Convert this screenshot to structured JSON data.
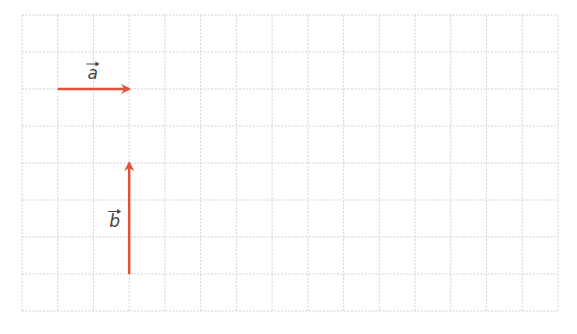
{
  "diagram": {
    "grid": {
      "x0": 22,
      "y0": 15,
      "cols": 15,
      "rows": 8,
      "cell_w": 35.73,
      "cell_h": 37,
      "color": "#c8c8c8"
    },
    "arrow_color": "#e0503a",
    "vectors": [
      {
        "name": "a",
        "label": "a",
        "from": [
          1,
          2
        ],
        "to": [
          3,
          2
        ]
      },
      {
        "name": "b",
        "label": "b",
        "from": [
          3,
          7
        ],
        "to": [
          3,
          4
        ]
      }
    ]
  }
}
